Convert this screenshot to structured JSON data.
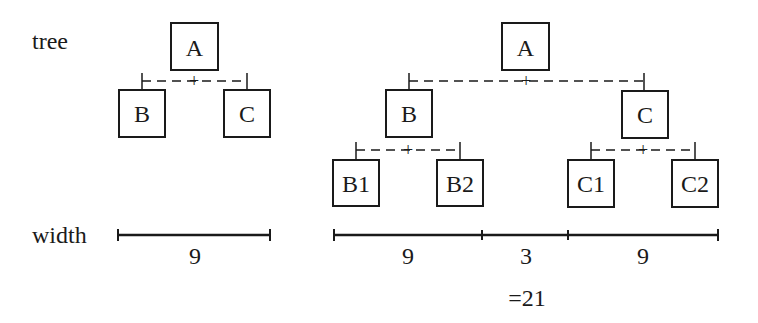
{
  "labels": {
    "tree": "tree",
    "width": "width"
  },
  "left_tree": {
    "root": "A",
    "children": [
      "B",
      "C"
    ],
    "join_symbol": "+",
    "width_value": "9"
  },
  "right_tree": {
    "root": "A",
    "children": [
      "B",
      "C"
    ],
    "grandchildren_b": [
      "B1",
      "B2"
    ],
    "grandchildren_c": [
      "C1",
      "C2"
    ],
    "join_symbol": "+",
    "segments": [
      "9",
      "3",
      "9"
    ],
    "total": "=21"
  },
  "colors": {
    "ink": "#1a1a1a",
    "background": "#ffffff"
  }
}
